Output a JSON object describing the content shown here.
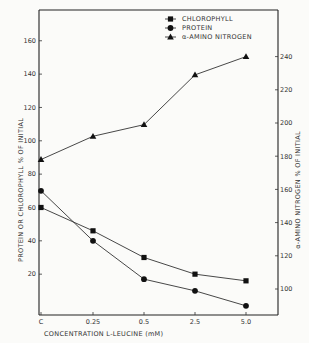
{
  "chart_data": {
    "type": "line",
    "title": "",
    "xlabel": "CONCENTRATION   L-LEUCINE  (mM)",
    "ylabel": "PROTEIN  OR  CHLOROPHYLL  % OF  INITIAL",
    "y2label": "α-AMINO  NITROGEN  % OF  INITIAL",
    "categories": [
      "C",
      "0.25",
      "0.5",
      "2.5",
      "5.0"
    ],
    "yticks": [
      20,
      40,
      60,
      80,
      100,
      120,
      140,
      160
    ],
    "y2ticks": [
      100,
      120,
      140,
      160,
      180,
      200,
      220,
      240
    ],
    "ylim": [
      0,
      180
    ],
    "y2lim": [
      95,
      245
    ],
    "grid": false,
    "legend_position": "top-right",
    "series": [
      {
        "name": "CHLOROPHYLL",
        "marker": "square",
        "axis": "left",
        "values": [
          60,
          46,
          30,
          20,
          16
        ]
      },
      {
        "name": "PROTEIN",
        "marker": "circle",
        "axis": "left",
        "values": [
          70,
          40,
          17,
          10,
          1
        ]
      },
      {
        "name": "α-AMINO  NITROGEN",
        "marker": "triangle",
        "axis": "right",
        "values": [
          178,
          192,
          199,
          229,
          240
        ]
      }
    ]
  },
  "legend": {
    "items": [
      "CHLOROPHYLL",
      "PROTEIN",
      "α-AMINO  NITROGEN"
    ]
  }
}
